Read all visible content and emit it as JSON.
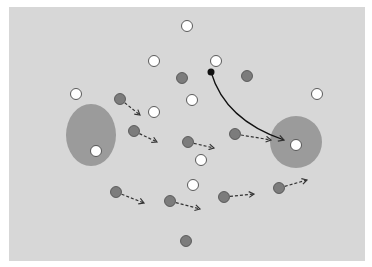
{
  "diagram": {
    "type": "tactical-play-diagram",
    "colors": {
      "page_background": "#ffffff",
      "field": "#d7d7d7",
      "zone": "#9b9b9b",
      "attacker_fill": "#ffffff",
      "defender_fill": "#7c7c7c",
      "outline": "#4a4a4a",
      "ball": "#111111",
      "arrow": "#333333"
    },
    "field": {
      "x": 9,
      "y": 7,
      "width": 356,
      "height": 254
    },
    "zones": [
      {
        "shape": "ellipse",
        "cx": 91,
        "cy": 135,
        "rx": 25,
        "ry": 31
      },
      {
        "shape": "circle",
        "cx": 296,
        "cy": 142,
        "rx": 26,
        "ry": 26
      }
    ],
    "attackers": [
      {
        "x": 187,
        "y": 26
      },
      {
        "x": 154,
        "y": 61
      },
      {
        "x": 216,
        "y": 61
      },
      {
        "x": 76,
        "y": 94
      },
      {
        "x": 317,
        "y": 94
      },
      {
        "x": 192,
        "y": 100
      },
      {
        "x": 154,
        "y": 112
      },
      {
        "x": 96,
        "y": 151
      },
      {
        "x": 296,
        "y": 145
      },
      {
        "x": 201,
        "y": 160
      },
      {
        "x": 193,
        "y": 185
      }
    ],
    "defenders": [
      {
        "x": 182,
        "y": 78
      },
      {
        "x": 247,
        "y": 76
      },
      {
        "x": 120,
        "y": 99,
        "arrow_to": [
          140,
          115
        ]
      },
      {
        "x": 134,
        "y": 131,
        "arrow_to": [
          157,
          142
        ]
      },
      {
        "x": 188,
        "y": 142,
        "arrow_to": [
          214,
          148
        ]
      },
      {
        "x": 235,
        "y": 134,
        "arrow_to": [
          271,
          140
        ]
      },
      {
        "x": 116,
        "y": 192,
        "arrow_to": [
          144,
          203
        ]
      },
      {
        "x": 170,
        "y": 201,
        "arrow_to": [
          200,
          209
        ]
      },
      {
        "x": 224,
        "y": 197,
        "arrow_to": [
          254,
          194
        ]
      },
      {
        "x": 279,
        "y": 188,
        "arrow_to": [
          307,
          180
        ]
      },
      {
        "x": 186,
        "y": 241
      }
    ],
    "ball": {
      "x": 211,
      "y": 72
    },
    "pass": {
      "from": [
        211,
        72
      ],
      "control": [
        225,
        120
      ],
      "to": [
        284,
        140
      ]
    }
  }
}
